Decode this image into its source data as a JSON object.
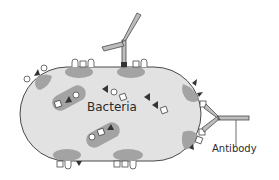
{
  "diagram": {
    "labels": {
      "bacteria": "Bacteria",
      "antibody": "Antibody"
    },
    "colors": {
      "cell_fill": "#e2e2e2",
      "cell_stroke": "#4a4a4a",
      "patch_fill": "#9a9a9a",
      "antigen_triangle": "#333333",
      "antigen_square_fill": "#ffffff",
      "antibody_fill": "#bdbdbd",
      "antibody_stroke": "#4a4a4a"
    },
    "elements": [
      "bacterium-cell",
      "surface-antigens",
      "internal-antigen-clusters",
      "antibody-top",
      "antibody-right",
      "antibody-label-leader"
    ]
  }
}
